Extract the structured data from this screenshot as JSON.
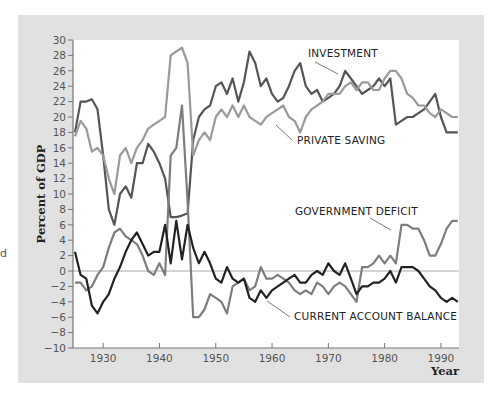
{
  "chart_data": {
    "type": "line",
    "title": "",
    "xlabel": "Year",
    "ylabel": "Percent of GDP",
    "xlim": [
      1925,
      1993
    ],
    "ylim": [
      -10,
      30
    ],
    "x_ticks": [
      1930,
      1940,
      1950,
      1960,
      1970,
      1980,
      1990
    ],
    "y_ticks": [
      -10,
      -8,
      -6,
      -4,
      -2,
      0,
      2,
      4,
      6,
      8,
      10,
      12,
      14,
      16,
      18,
      20,
      22,
      24,
      26,
      28,
      30
    ],
    "grid": false,
    "zero_line": true,
    "legend": "inline labels with leader lines",
    "x": [
      1925,
      1926,
      1927,
      1928,
      1929,
      1930,
      1931,
      1932,
      1933,
      1934,
      1935,
      1936,
      1937,
      1938,
      1939,
      1940,
      1941,
      1942,
      1943,
      1944,
      1945,
      1946,
      1947,
      1948,
      1949,
      1950,
      1951,
      1952,
      1953,
      1954,
      1955,
      1956,
      1957,
      1958,
      1959,
      1960,
      1961,
      1962,
      1963,
      1964,
      1965,
      1966,
      1967,
      1968,
      1969,
      1970,
      1971,
      1972,
      1973,
      1974,
      1975,
      1976,
      1977,
      1978,
      1979,
      1980,
      1981,
      1982,
      1983,
      1984,
      1985,
      1986,
      1987,
      1988,
      1989,
      1990,
      1991,
      1992,
      1993
    ],
    "series": [
      {
        "name": "INVESTMENT",
        "color": "#555555",
        "values": [
          18,
          22,
          22,
          22.3,
          21,
          15,
          8,
          6,
          10,
          11,
          9.5,
          14,
          14,
          16.5,
          15.5,
          14,
          12,
          7,
          7,
          7.2,
          7.5,
          17,
          20,
          21,
          21.5,
          24,
          24.5,
          23,
          25,
          22,
          24.5,
          28.5,
          27,
          24,
          25,
          23,
          22,
          22.5,
          24,
          26,
          27,
          24,
          23,
          23.5,
          22,
          22.5,
          23,
          24,
          26,
          25,
          24,
          23,
          23.5,
          24,
          25,
          24,
          25,
          19,
          19.5,
          20,
          20,
          20.5,
          21,
          22,
          23,
          20,
          18,
          18,
          18
        ]
      },
      {
        "name": "PRIVATE SAVING",
        "color": "#9a9a9a",
        "values": [
          17.5,
          19.5,
          18.5,
          15.5,
          16,
          15,
          12,
          10,
          15,
          16,
          14,
          16,
          17,
          18.5,
          19,
          19.5,
          20,
          28,
          28.5,
          29,
          27,
          15,
          17,
          18,
          17,
          20,
          21,
          20,
          21.5,
          20,
          21.5,
          20,
          19.5,
          19,
          20,
          20.5,
          21,
          21.5,
          20,
          19.5,
          18,
          20,
          21,
          21.5,
          22,
          23,
          23,
          23,
          24,
          24.5,
          23.5,
          24.5,
          24.5,
          23.5,
          23.5,
          25,
          26,
          26,
          25,
          23,
          22.5,
          21.5,
          21.5,
          20.5,
          20,
          21,
          20.5,
          20,
          20
        ]
      },
      {
        "name": "GOVERNMENT DEFICIT",
        "color": "#7d7d7d",
        "values": [
          -1.5,
          -1.5,
          -2.5,
          -2,
          -0.5,
          0.5,
          3,
          5,
          5.5,
          4.5,
          4,
          3.5,
          2,
          0,
          -0.5,
          1,
          -0.5,
          15,
          16,
          21.5,
          9,
          -6,
          -6,
          -5,
          -3,
          -3.5,
          -4,
          -5.5,
          -2,
          -1.5,
          -1,
          -2.5,
          -2,
          0.5,
          -1,
          -1,
          -0.5,
          -1,
          -1.5,
          -2.5,
          -3,
          -2.5,
          -3,
          -1.5,
          -2,
          -3,
          -2,
          -1.5,
          -2,
          -3,
          -4,
          0.5,
          0.5,
          1,
          2,
          1,
          2,
          1,
          6,
          6,
          5.5,
          5.5,
          4,
          2,
          2,
          3.5,
          5.5,
          6.5,
          6.5
        ]
      },
      {
        "name": "CURRENT ACCOUNT BALANCE",
        "color": "#222222",
        "values": [
          2.5,
          -0.5,
          -1,
          -4.5,
          -5.5,
          -4,
          -3,
          -1,
          0.5,
          2.5,
          4,
          5,
          3.5,
          2,
          2.5,
          2.5,
          6,
          1,
          6.5,
          1.5,
          6,
          3,
          1,
          2.5,
          1,
          -1,
          -1.5,
          0.5,
          -1,
          -1.5,
          -1,
          -3.5,
          -4,
          -2.5,
          -3.5,
          -2.5,
          -2,
          -1.5,
          -1,
          -0.5,
          -1.5,
          -1.5,
          -0.5,
          0,
          -0.5,
          1,
          0,
          -0.5,
          1,
          -1,
          -3,
          -2,
          -2,
          -1.5,
          -1.5,
          -1,
          0,
          -1.5,
          0.5,
          0.5,
          0.5,
          0,
          -1,
          -2,
          -2.5,
          -3.5,
          -4,
          -3.5,
          -4
        ]
      }
    ],
    "annotations": [
      {
        "text": "INVESTMENT",
        "x_px": 308,
        "y_px": 57
      },
      {
        "text": "PRIVATE SAVING",
        "x_px": 297,
        "y_px": 144
      },
      {
        "text": "GOVERNMENT DEFICIT",
        "x_px": 295,
        "y_px": 215
      },
      {
        "text": "CURRENT ACCOUNT BALANCE",
        "x_px": 294,
        "y_px": 320
      }
    ]
  },
  "labels": {
    "ylabel": "Percent of GDP",
    "xlabel": "Year",
    "investment": "INVESTMENT",
    "private_saving": "PRIVATE SAVING",
    "government_deficit": "GOVERNMENT DEFICIT",
    "current_account": "CURRENT ACCOUNT BALANCE",
    "stray_char": "d"
  },
  "colors": {
    "panel_bg": "#e1e1e1",
    "plot_bg": "#ffffff",
    "axis": "#777777",
    "zero_line": "#aaaaaa"
  }
}
